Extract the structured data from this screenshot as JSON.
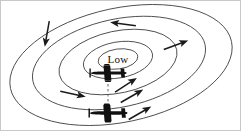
{
  "figure": {
    "center_label": "Low",
    "background_color": "#ffffff",
    "contour_color": "#4a4a4a",
    "arrow_color": "#1a1a1a",
    "aircraft_color": "#111111",
    "frame_color": "#c8c8c8"
  },
  "chart_data": {
    "type": "diagram",
    "title": "",
    "subtitle": "",
    "xlabel": "",
    "ylabel": "",
    "annotations": [
      {
        "name": "pressure-center",
        "text": "Low",
        "x": 117,
        "y": 58
      }
    ],
    "isobars": [
      {
        "name": "isobar-outer",
        "cx": 120,
        "cy": 64,
        "rx": 113,
        "ry": 57,
        "rotation": -12
      },
      {
        "name": "isobar-second",
        "cx": 118,
        "cy": 62,
        "rx": 88,
        "ry": 44,
        "rotation": -12
      },
      {
        "name": "isobar-third",
        "cx": 117,
        "cy": 61,
        "rx": 60,
        "ry": 31,
        "rotation": -12
      },
      {
        "name": "isobar-fourth",
        "cx": 117,
        "cy": 59,
        "rx": 35,
        "ry": 18,
        "rotation": -10
      },
      {
        "name": "isobar-center",
        "cx": 117,
        "cy": 58,
        "rx": 20,
        "ry": 10,
        "rotation": -8
      }
    ],
    "wind_arrows": [
      {
        "name": "wind-arrow-top",
        "x": 122,
        "y": 23,
        "angle": 188,
        "length": 26
      },
      {
        "name": "wind-arrow-upper-left",
        "x": 46,
        "y": 33,
        "angle": 100,
        "length": 24
      },
      {
        "name": "wind-arrow-right",
        "x": 175,
        "y": 44,
        "angle": 340,
        "length": 24
      },
      {
        "name": "wind-arrow-lower-left",
        "x": 72,
        "y": 93,
        "angle": 12,
        "length": 26
      },
      {
        "name": "wind-arrow-mid-right",
        "x": 125,
        "y": 84,
        "angle": 327,
        "length": 26
      },
      {
        "name": "wind-arrow-inner-right",
        "x": 131,
        "y": 95,
        "angle": 330,
        "length": 26
      },
      {
        "name": "wind-arrow-bottom-right",
        "x": 139,
        "y": 112,
        "angle": 330,
        "length": 28
      }
    ],
    "aircraft": [
      {
        "name": "aircraft-upper",
        "x": 107,
        "y": 72,
        "heading": "left",
        "scale": 1.0
      },
      {
        "name": "aircraft-lower",
        "x": 107,
        "y": 112,
        "heading": "left",
        "scale": 1.05
      }
    ],
    "connector": {
      "name": "aircraft-link",
      "x1": 107,
      "y1": 78,
      "x2": 107,
      "y2": 106,
      "style": "dashed"
    },
    "legend": [],
    "grid": false
  }
}
